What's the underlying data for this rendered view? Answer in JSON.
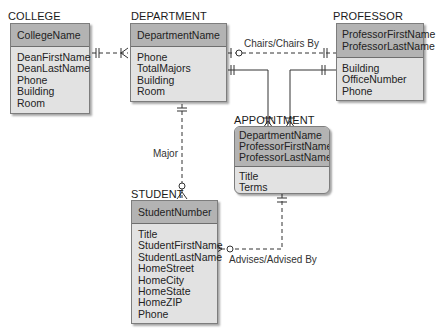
{
  "entities": {
    "college": {
      "name": "COLLEGE",
      "keys": [
        "CollegeName"
      ],
      "attributes": [
        "DeanFirstName",
        "DeanLastName",
        "Phone",
        "Building",
        "Room"
      ]
    },
    "department": {
      "name": "DEPARTMENT",
      "keys": [
        "DepartmentName"
      ],
      "attributes": [
        "Phone",
        "TotalMajors",
        "Building",
        "Room"
      ]
    },
    "professor": {
      "name": "PROFESSOR",
      "keys": [
        "ProfessorFirstName",
        "ProfessorLastName"
      ],
      "attributes": [
        "Building",
        "OfficeNumber",
        "Phone"
      ]
    },
    "appointment": {
      "name": "APPOINTMENT",
      "keys": [
        "DepartmentName",
        "ProfessorFirstName",
        "ProfessorLastName"
      ],
      "attributes": [
        "Title",
        "Terms"
      ]
    },
    "student": {
      "name": "STUDENT",
      "keys": [
        "StudentNumber"
      ],
      "attributes": [
        "Title",
        "StudentFirstName",
        "StudentLastName",
        "HomeStreet",
        "HomeCity",
        "HomeState",
        "HomeZIP",
        "Phone"
      ]
    }
  },
  "relationships": {
    "chairs": "Chairs/Chairs By",
    "major": "Major",
    "advises": "Advises/Advised By"
  }
}
